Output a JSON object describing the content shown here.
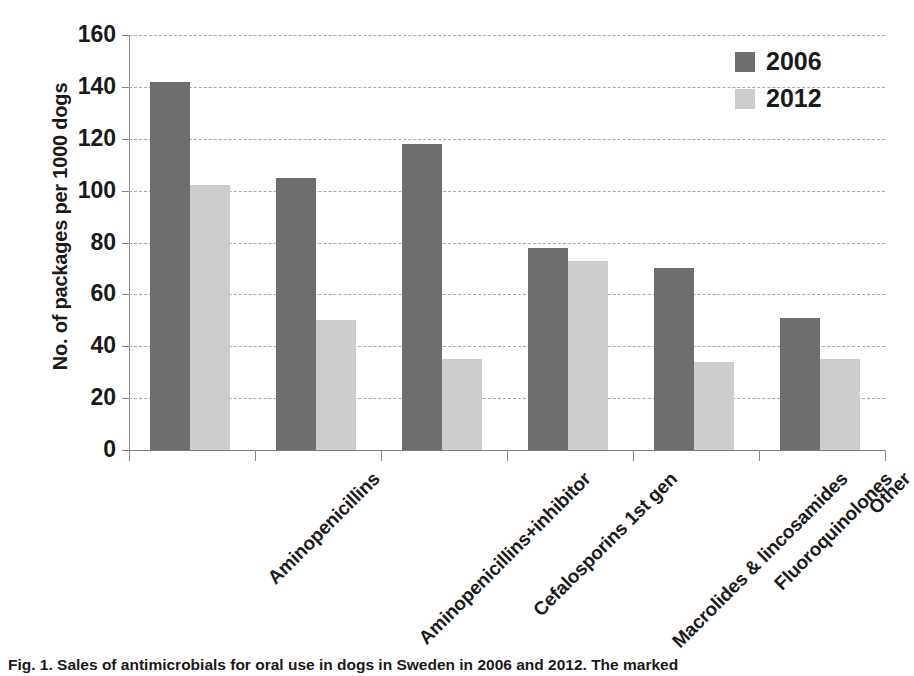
{
  "chart_data": {
    "type": "bar",
    "title": "",
    "xlabel": "",
    "ylabel": "No. of packages per 1000 dogs",
    "ylim": [
      0,
      160
    ],
    "ytick_step": 20,
    "yticks": [
      160,
      140,
      120,
      100,
      80,
      60,
      40,
      20,
      0
    ],
    "grid": true,
    "legend_position": "top-right",
    "categories": [
      "Aminopenicillins",
      "Aminopenicillins+inhibitor",
      "Cefalosporins 1st gen",
      "Macrolides & lincosamides",
      "Fluoroquinolones",
      "Other"
    ],
    "series": [
      {
        "name": "2006",
        "color": "#6e6e6e",
        "values": [
          142,
          105,
          118,
          78,
          70,
          51
        ]
      },
      {
        "name": "2012",
        "color": "#cdcdcd",
        "values": [
          102,
          50,
          35,
          73,
          34,
          35
        ]
      }
    ]
  },
  "legend": {
    "items": [
      {
        "label": "2006",
        "color": "#6e6e6e"
      },
      {
        "label": "2012",
        "color": "#cdcdcd"
      }
    ]
  },
  "caption": {
    "text": "Fig. 1. Sales of antimicrobials for oral use in dogs in Sweden in 2006 and 2012. The marked"
  }
}
